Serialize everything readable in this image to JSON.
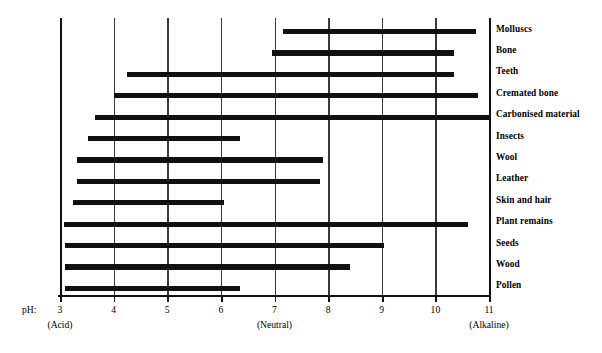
{
  "chart_data": {
    "type": "bar",
    "orientation": "horizontal",
    "subtype": "range-bar",
    "title": "",
    "xlabel": "pH",
    "ylabel": "",
    "xlim": [
      3,
      11
    ],
    "grid": true,
    "legend": false,
    "axis_prefix": "pH:",
    "x_ticks": [
      3,
      4,
      5,
      6,
      7,
      8,
      9,
      10,
      11
    ],
    "x_tick_labels": [
      "3",
      "4",
      "5",
      "6",
      "7",
      "8",
      "9",
      "10",
      "11"
    ],
    "zone_annotations": [
      {
        "label": "(Acid)",
        "at": 3
      },
      {
        "label": "(Neutral)",
        "at": 7
      },
      {
        "label": "(Alkaline)",
        "at": 11
      }
    ],
    "categories": [
      "Molluscs",
      "Bone",
      "Teeth",
      "Cremated bone",
      "Carbonised material",
      "Insects",
      "Wool",
      "Leather",
      "Skin and hair",
      "Plant remains",
      "Seeds",
      "Wood",
      "Pollen"
    ],
    "ranges": [
      {
        "name": "Molluscs",
        "start": 7.15,
        "end": 10.75
      },
      {
        "name": "Bone",
        "start": 6.95,
        "end": 10.35
      },
      {
        "name": "Teeth",
        "start": 4.25,
        "end": 10.35
      },
      {
        "name": "Cremated bone",
        "start": 4.0,
        "end": 10.8
      },
      {
        "name": "Carbonised material",
        "start": 3.65,
        "end": 11.0
      },
      {
        "name": "Insects",
        "start": 3.52,
        "end": 6.35
      },
      {
        "name": "Wool",
        "start": 3.32,
        "end": 7.9
      },
      {
        "name": "Leather",
        "start": 3.32,
        "end": 7.85
      },
      {
        "name": "Skin and hair",
        "start": 3.25,
        "end": 6.05
      },
      {
        "name": "Plant remains",
        "start": 3.08,
        "end": 10.6
      },
      {
        "name": "Seeds",
        "start": 3.1,
        "end": 9.05
      },
      {
        "name": "Wood",
        "start": 3.1,
        "end": 8.4
      },
      {
        "name": "Pollen",
        "start": 3.1,
        "end": 6.35
      }
    ],
    "colors": {
      "bar": "#111111",
      "gridline": "#3a3a3a",
      "axis": "#111111",
      "background": "#ffffff",
      "text": "#000000"
    }
  }
}
